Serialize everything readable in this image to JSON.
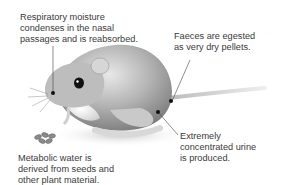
{
  "diagram": {
    "annotations": [
      {
        "id": "respiratory",
        "lines": [
          "Respiratory moisture",
          "condenses in the nasal",
          "passages and is reabsorbed."
        ]
      },
      {
        "id": "faeces",
        "lines": [
          "Faeces are egested",
          "as very dry pellets."
        ]
      },
      {
        "id": "urine",
        "lines": [
          "Extremely",
          "concentrated urine",
          "is produced."
        ]
      },
      {
        "id": "metabolic",
        "lines": [
          "Metabolic water is",
          "derived from seeds and",
          "other plant material."
        ]
      }
    ],
    "colors": {
      "text": "#3a3a3a",
      "leader_line": "#444444",
      "marker": "#111111"
    }
  }
}
